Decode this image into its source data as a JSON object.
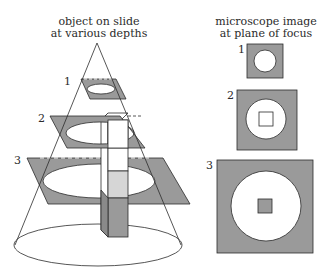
{
  "left_panel": {
    "title_line1": "object on slide",
    "title_line2": "at various depths",
    "planes": [
      {
        "label": "1"
      },
      {
        "label": "2"
      },
      {
        "label": "3"
      }
    ]
  },
  "right_panel": {
    "title_line1": "microscope image",
    "title_line2": "at plane of focus",
    "images": [
      {
        "label": "1",
        "shows": "ring of light, no object"
      },
      {
        "label": "2",
        "shows": "object outline in focus"
      },
      {
        "label": "3",
        "shows": "object cross-section shaded"
      }
    ]
  },
  "colors": {
    "plane_fill": "#9a9a9a",
    "stroke": "#2b2b2b",
    "column_light": "#d6d6d6",
    "column_dark": "#9a9a9a",
    "background": "#ffffff"
  }
}
